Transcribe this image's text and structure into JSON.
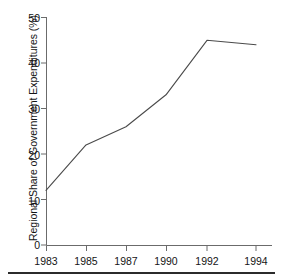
{
  "figure": {
    "background_color": "#ffffff",
    "line_color": "#4a4a4a",
    "axis_color": "#6b6b6b",
    "text_color": "#141414",
    "rule_color": "#2b2b2b"
  },
  "chart_data": {
    "type": "line",
    "title": "",
    "xlabel": "",
    "ylabel": "Regional Share of Government Expenditures (%)",
    "categories": [
      "1983",
      "1985",
      "1987",
      "1990",
      "1992",
      "1994"
    ],
    "x": [
      1983,
      1985,
      1987,
      1990,
      1992,
      1994
    ],
    "values": [
      12,
      22,
      26,
      33,
      45,
      44
    ],
    "series": [
      {
        "name": "Regional Share of Government Expenditures",
        "values": [
          12,
          22,
          26,
          33,
          45,
          44
        ]
      }
    ],
    "ylim": [
      0,
      50
    ],
    "yticks": [
      0,
      10,
      20,
      30,
      40,
      50
    ],
    "ytick_labels": [
      "0",
      "10",
      "20",
      "30",
      "40",
      "50"
    ],
    "xtick_labels": [
      "1983",
      "1985",
      "1987",
      "1990",
      "1992",
      "1994"
    ],
    "grid": false,
    "legend": false,
    "legend_position": "none",
    "spines": [
      "left",
      "bottom"
    ],
    "tick_direction": "out",
    "annotations": []
  },
  "axis": {
    "y_title": "Regional Share of Government Expenditures (%)",
    "y_ticks": [
      {
        "label": "50"
      },
      {
        "label": "40"
      },
      {
        "label": "30"
      },
      {
        "label": "20"
      },
      {
        "label": "10"
      },
      {
        "label": "0"
      }
    ],
    "x_ticks": [
      {
        "label": "1983"
      },
      {
        "label": "1985"
      },
      {
        "label": "1987"
      },
      {
        "label": "1990"
      },
      {
        "label": "1992"
      },
      {
        "label": "1994"
      }
    ]
  }
}
